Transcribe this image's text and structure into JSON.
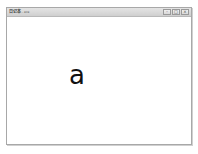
{
  "window": {
    "title_app": "日记本",
    "title_suffix": "- exe",
    "controls": {
      "minimize": "–",
      "maximize": "□",
      "close": "×"
    }
  },
  "content": {
    "displayed_text": "a"
  }
}
